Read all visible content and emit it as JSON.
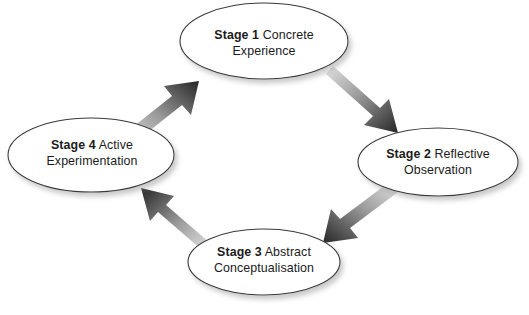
{
  "diagram": {
    "background_color": "#ffffff",
    "node_fill": "#ffffff",
    "node_stroke": "#3a3a3a",
    "arrow_dark": "#2b2b2b",
    "arrow_light": "#d8d8d8",
    "text_color": "#1b1b1b",
    "shadow_color": "#cfcfcf",
    "nodes": [
      {
        "id": "stage1",
        "stage": "Stage 1",
        "name": "Concrete Experience",
        "line1": "Concrete",
        "line2": "Experience",
        "cx": 264,
        "cy": 41,
        "rx": 84,
        "ry": 38
      },
      {
        "id": "stage2",
        "stage": "Stage 2",
        "name": "Reflective Observation",
        "line1": "Reflective",
        "line2": "Observation",
        "cx": 438,
        "cy": 162,
        "rx": 80,
        "ry": 34
      },
      {
        "id": "stage3",
        "stage": "Stage 3",
        "name": "Abstract Conceptualisation",
        "line1": "Abstract",
        "line2": "Conceptualisation",
        "cx": 264,
        "cy": 262,
        "rx": 76,
        "ry": 33
      },
      {
        "id": "stage4",
        "stage": "Stage 4",
        "name": "Active Experimentation",
        "line1": "Active",
        "line2": "Experimentation",
        "cx": 91,
        "cy": 155,
        "rx": 83,
        "ry": 37
      }
    ],
    "arrows": [
      {
        "id": "arrow-stage1-to-stage2",
        "from": "stage1",
        "to": "stage2",
        "direction": "down-right"
      },
      {
        "id": "arrow-stage2-to-stage3",
        "from": "stage2",
        "to": "stage3",
        "direction": "down-left"
      },
      {
        "id": "arrow-stage3-to-stage4",
        "from": "stage3",
        "to": "stage4",
        "direction": "up-left"
      },
      {
        "id": "arrow-stage4-to-stage1",
        "from": "stage4",
        "to": "stage1",
        "direction": "up-right"
      }
    ],
    "caption": ""
  }
}
